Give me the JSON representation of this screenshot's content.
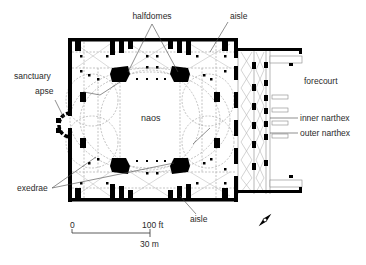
{
  "diagram": {
    "type": "architectural floor plan",
    "colors": {
      "wall": "#000000",
      "dashed_lines": "#8a8a8a",
      "label_text": "#2a2a2a",
      "leader_lines": "#444444",
      "background": "#ffffff"
    }
  },
  "labels": {
    "halfdomes": "halfdomes",
    "aisle_top": "aisle",
    "sanctuary_line1": "sanctuary",
    "sanctuary_line2": "apse",
    "naos": "naos",
    "forecourt": "forecourt",
    "inner_narthex": "inner narthex",
    "outer_narthex": "outer narthex",
    "exedrae": "exedrae",
    "aisle_bottom": "aisle"
  },
  "scale_bar": {
    "start_label": "0",
    "end_label_ft": "100 ft",
    "end_label_m": "30 m"
  },
  "north_arrow": {
    "icon": "north-arrow-icon",
    "orientation": "diagonal pointing lower-right"
  }
}
